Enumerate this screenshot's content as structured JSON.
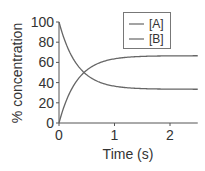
{
  "chart_data": {
    "type": "line",
    "title": "",
    "xlabel": "Time (s)",
    "ylabel": "% concentration",
    "xlim": [
      0,
      2.5
    ],
    "ylim": [
      0,
      100
    ],
    "x_ticks": [
      "0",
      "1",
      "2"
    ],
    "y_ticks": [
      "0",
      "20",
      "40",
      "60",
      "80",
      "100"
    ],
    "grid": false,
    "legend_position": "upper right",
    "x": [
      0,
      0.1,
      0.2,
      0.3,
      0.4,
      0.5,
      0.6,
      0.8,
      1.0,
      1.25,
      1.5,
      2.0,
      2.5
    ],
    "series": [
      {
        "name": "[A]",
        "color": "#666666",
        "values": [
          100,
          82.2,
          69.2,
          59.7,
          52.7,
          47.7,
          43.9,
          39.0,
          36.4,
          34.7,
          34.0,
          33.5,
          33.4
        ]
      },
      {
        "name": "[B]",
        "color": "#666666",
        "values": [
          0,
          17.8,
          30.8,
          40.3,
          47.3,
          52.3,
          56.1,
          61.0,
          63.6,
          65.3,
          66.0,
          66.5,
          66.6
        ]
      }
    ]
  }
}
